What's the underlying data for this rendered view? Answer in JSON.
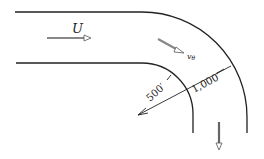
{
  "diagram": {
    "labels": {
      "uniform_velocity": "U",
      "tangential_velocity_symbol": "v",
      "tangential_velocity_subscript": "θ",
      "inner_radius": "500′",
      "outer_radius": "1,000′"
    },
    "colors": {
      "line": "#222222",
      "arrow_fill": "#888888",
      "background": "#ffffff"
    }
  }
}
